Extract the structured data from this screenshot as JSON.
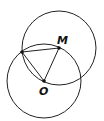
{
  "diagram": {
    "stroke_color": "#222222",
    "points": {
      "M": {
        "label": "M",
        "x": 59,
        "y": 48
      },
      "O": {
        "label": "O",
        "x": 44,
        "y": 81
      },
      "A": {
        "label": "",
        "x": 22,
        "y": 52
      }
    },
    "circles": [
      {
        "name": "circle-M",
        "cx": 59,
        "cy": 48,
        "r": 37
      },
      {
        "name": "circle-O",
        "cx": 44,
        "cy": 81,
        "r": 37
      }
    ],
    "segments": [
      [
        "A",
        "M"
      ],
      [
        "A",
        "O"
      ],
      [
        "M",
        "O"
      ]
    ],
    "arc_note": "arc from A to M along circle O"
  }
}
